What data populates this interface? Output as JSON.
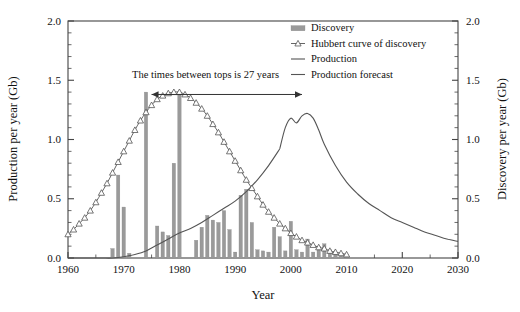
{
  "chart_data": {
    "type": "bar",
    "title": "",
    "xlabel": "Year",
    "ylabel_left": "Production per year (Gb)",
    "ylabel_right": "Discovery per year (Gb)",
    "xlim": [
      1960,
      2030
    ],
    "ylim": [
      0.0,
      2.0
    ],
    "xticks": [
      1960,
      1970,
      1980,
      1990,
      2000,
      2010,
      2020,
      2030
    ],
    "xticklabels": [
      "1960",
      "1970",
      "1980",
      "1990",
      "2000",
      "2010",
      "2020",
      "2030"
    ],
    "yticks": [
      0.0,
      0.5,
      1.0,
      1.5,
      2.0
    ],
    "yticklabels": [
      "0.0",
      "0.5",
      "1.0",
      "1.5",
      "2.0"
    ],
    "yticklabels_right": [
      "0.0",
      "0.5",
      "1.0",
      "1.5",
      "2.0"
    ],
    "grid": false,
    "legend_position": "top-right",
    "legend": [
      {
        "label": "Discovery",
        "marker": "bar-swatch",
        "color": "#9a9a9a"
      },
      {
        "label": "Hubbert curve of discovery",
        "marker": "line-triangle",
        "color": "#555555"
      },
      {
        "label": "Production",
        "marker": "line",
        "color": "#555555"
      },
      {
        "label": "Production forecast",
        "marker": "line",
        "color": "#555555"
      }
    ],
    "annotations": [
      {
        "text": "The times between tops is 27 years",
        "x": 1975,
        "y": 1.47,
        "arrow_from_year": 1975,
        "arrow_to_year": 2002,
        "arrow_y": 1.38
      }
    ],
    "series": [
      {
        "name": "Discovery",
        "type": "bar",
        "color": "#9a9a9a",
        "axis": "right",
        "x": [
          1961,
          1962,
          1963,
          1964,
          1965,
          1966,
          1967,
          1968,
          1969,
          1970,
          1971,
          1972,
          1973,
          1974,
          1975,
          1976,
          1977,
          1978,
          1979,
          1980,
          1981,
          1982,
          1983,
          1984,
          1985,
          1986,
          1987,
          1988,
          1989,
          1990,
          1991,
          1992,
          1993,
          1994,
          1995,
          1996,
          1997,
          1998,
          1999,
          2000,
          2001,
          2002,
          2003,
          2004,
          2005,
          2006,
          2007,
          2008,
          2009,
          2010
        ],
        "values": [
          0.0,
          0.0,
          0.0,
          0.0,
          0.0,
          0.0,
          0.0,
          0.08,
          0.7,
          0.43,
          0.04,
          0.0,
          0.0,
          1.4,
          0.0,
          0.27,
          0.22,
          0.19,
          0.8,
          1.4,
          0.0,
          0.0,
          0.15,
          0.26,
          0.36,
          0.32,
          0.3,
          0.4,
          0.24,
          0.05,
          0.53,
          0.58,
          0.3,
          0.07,
          0.06,
          0.05,
          0.26,
          0.18,
          0.06,
          0.31,
          0.07,
          0.05,
          0.16,
          0.05,
          0.1,
          0.12,
          0.07,
          0.05,
          0.04,
          0.03
        ]
      },
      {
        "name": "Hubbert curve of discovery",
        "type": "line",
        "marker": "triangle-up",
        "color": "#555555",
        "axis": "right",
        "x": [
          1960,
          1961,
          1962,
          1963,
          1964,
          1965,
          1966,
          1967,
          1968,
          1969,
          1970,
          1971,
          1972,
          1973,
          1974,
          1975,
          1976,
          1977,
          1978,
          1979,
          1980,
          1981,
          1982,
          1983,
          1984,
          1985,
          1986,
          1987,
          1988,
          1989,
          1990,
          1991,
          1992,
          1993,
          1994,
          1995,
          1996,
          1997,
          1998,
          1999,
          2000,
          2001,
          2002,
          2003,
          2004,
          2005,
          2006,
          2007,
          2008,
          2009,
          2010
        ],
        "values": [
          0.2,
          0.24,
          0.29,
          0.34,
          0.4,
          0.47,
          0.55,
          0.63,
          0.72,
          0.81,
          0.9,
          0.99,
          1.08,
          1.16,
          1.23,
          1.29,
          1.34,
          1.37,
          1.39,
          1.4,
          1.4,
          1.38,
          1.35,
          1.31,
          1.26,
          1.2,
          1.13,
          1.06,
          0.98,
          0.9,
          0.82,
          0.74,
          0.66,
          0.59,
          0.52,
          0.45,
          0.39,
          0.34,
          0.29,
          0.25,
          0.21,
          0.18,
          0.15,
          0.13,
          0.11,
          0.09,
          0.08,
          0.06,
          0.05,
          0.04,
          0.03
        ]
      },
      {
        "name": "Production",
        "type": "line",
        "color": "#555555",
        "axis": "left",
        "x": [
          1960,
          1962,
          1964,
          1966,
          1968,
          1970,
          1972,
          1974,
          1976,
          1978,
          1980,
          1982,
          1984,
          1986,
          1988,
          1990,
          1992,
          1994,
          1996,
          1998
        ],
        "values": [
          0.0,
          0.0,
          0.0,
          0.0,
          0.0,
          0.01,
          0.03,
          0.06,
          0.11,
          0.16,
          0.21,
          0.25,
          0.3,
          0.36,
          0.42,
          0.48,
          0.56,
          0.66,
          0.78,
          0.92
        ]
      },
      {
        "name": "Production forecast",
        "type": "line",
        "color": "#555555",
        "axis": "left",
        "x": [
          1998,
          1999,
          2000,
          2001,
          2002,
          2003,
          2004,
          2005,
          2006,
          2008,
          2010,
          2012,
          2014,
          2016,
          2018,
          2020,
          2022,
          2024,
          2026,
          2028,
          2030
        ],
        "values": [
          0.92,
          1.1,
          1.18,
          1.14,
          1.2,
          1.22,
          1.18,
          1.08,
          0.96,
          0.78,
          0.64,
          0.54,
          0.46,
          0.4,
          0.34,
          0.3,
          0.26,
          0.22,
          0.19,
          0.16,
          0.14
        ]
      }
    ]
  },
  "axes": {
    "x_title": "Year",
    "y_left_title": "Production per year (Gb)",
    "y_right_title": "Discovery per year (Gb)"
  }
}
